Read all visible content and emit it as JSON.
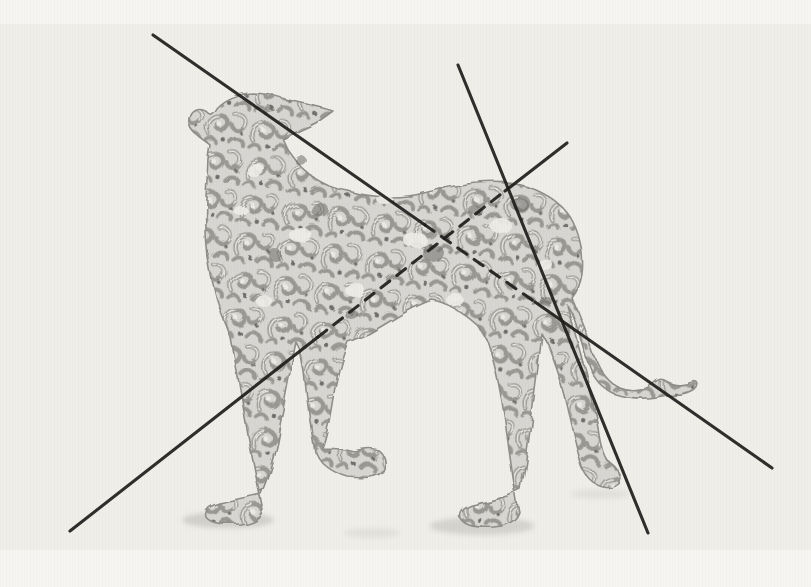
{
  "page": {
    "kind": "scanned book illustration",
    "text_content": []
  },
  "canvas": {
    "width": 811,
    "height": 587,
    "art_area": {
      "x": 0,
      "y": 24,
      "width": 811,
      "height": 526
    }
  },
  "palette": {
    "page_background": "#f6f5f2",
    "art_background": "#efeee9",
    "dog_base": "#d7d6d2",
    "ribbon_light": "#eceae6",
    "ribbon_shade": "#9a9892",
    "accent_dark": "#6f6e6a",
    "outline": "#8f8e88",
    "analysis_line": "#1f1e1c",
    "ground_shadow": "#b3b2ad"
  },
  "dog": {
    "subject": "saluki / greyhound-type hound",
    "style": "arabesque filigree openwork, grey tones on paper",
    "pose": "standing in profile, body facing left, head raised with muzzle turned back to the right, one foreleg lifted mid-step",
    "tail": "long low tail sweeping right with upturned curled tip"
  },
  "analysis_lines": [
    {
      "name": "long-diagonal-head-to-haunch",
      "segments": [
        {
          "x1": 153,
          "y1": 35,
          "x2": 425,
          "y2": 225,
          "style": "solid"
        },
        {
          "x1": 425,
          "y1": 225,
          "x2": 535,
          "y2": 302,
          "style": "dashed"
        },
        {
          "x1": 535,
          "y1": 302,
          "x2": 772,
          "y2": 468,
          "style": "solid"
        }
      ]
    },
    {
      "name": "steep-croup-line",
      "segments": [
        {
          "x1": 458,
          "y1": 65,
          "x2": 648,
          "y2": 533,
          "style": "solid"
        }
      ]
    },
    {
      "name": "long-diagonal-chest-to-hip",
      "segments": [
        {
          "x1": 70,
          "y1": 531,
          "x2": 318,
          "y2": 337,
          "style": "solid"
        },
        {
          "x1": 318,
          "y1": 337,
          "x2": 505,
          "y2": 191,
          "style": "dashed"
        },
        {
          "x1": 505,
          "y1": 191,
          "x2": 567,
          "y2": 143,
          "style": "solid"
        }
      ]
    }
  ],
  "line_style": {
    "width": 3.1,
    "dash": "11 9",
    "cap": "round",
    "opacity": 0.92
  },
  "ground_shadows": [
    {
      "cx": 228,
      "cy": 520,
      "rx": 46,
      "ry": 8,
      "opacity": 0.5
    },
    {
      "cx": 372,
      "cy": 533,
      "rx": 28,
      "ry": 5,
      "opacity": 0.22
    },
    {
      "cx": 482,
      "cy": 526,
      "rx": 52,
      "ry": 9,
      "opacity": 0.45
    },
    {
      "cx": 600,
      "cy": 494,
      "rx": 30,
      "ry": 5,
      "opacity": 0.22
    }
  ]
}
